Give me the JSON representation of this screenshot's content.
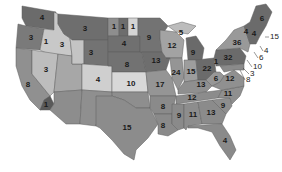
{
  "map": {
    "title": "US electoral votes by state",
    "colors": {
      "dark": "#6b6b6b",
      "medium": "#8e8e8e",
      "light": "#b8b8b8",
      "lighter": "#d0d0d0",
      "water": "#ffffff"
    },
    "states": [
      {
        "id": "WA",
        "votes": "4",
        "x": 42,
        "y": 18
      },
      {
        "id": "OR",
        "votes": "3",
        "x": 31,
        "y": 38
      },
      {
        "id": "ID",
        "votes": "1",
        "x": 46,
        "y": 42
      },
      {
        "id": "MT",
        "votes": "3",
        "x": 85,
        "y": 29
      },
      {
        "id": "ND-a",
        "votes": "1",
        "x": 114,
        "y": 27
      },
      {
        "id": "ND-b",
        "votes": "1",
        "x": 123,
        "y": 27
      },
      {
        "id": "ND-c",
        "votes": "1",
        "x": 133,
        "y": 27
      },
      {
        "id": "WY",
        "votes": "3",
        "x": 62,
        "y": 45
      },
      {
        "id": "SD",
        "votes": "3",
        "x": 91,
        "y": 53
      },
      {
        "id": "NE-upper",
        "votes": "4",
        "x": 124,
        "y": 44
      },
      {
        "id": "NV",
        "votes": "3",
        "x": 46,
        "y": 70
      },
      {
        "id": "CA",
        "votes": "8",
        "x": 28,
        "y": 85
      },
      {
        "id": "CO",
        "votes": "4",
        "x": 98,
        "y": 80
      },
      {
        "id": "KS",
        "votes": "10",
        "x": 131,
        "y": 84
      },
      {
        "id": "NE",
        "votes": "8",
        "x": 127,
        "y": 65
      },
      {
        "id": "AZ",
        "votes": "1",
        "x": 46,
        "y": 105
      },
      {
        "id": "TX",
        "votes": "15",
        "x": 127,
        "y": 128
      },
      {
        "id": "MN",
        "votes": "9",
        "x": 149,
        "y": 38
      },
      {
        "id": "IA",
        "votes": "13",
        "x": 156,
        "y": 61
      },
      {
        "id": "MO",
        "votes": "17",
        "x": 160,
        "y": 85
      },
      {
        "id": "AR",
        "votes": "8",
        "x": 163,
        "y": 107
      },
      {
        "id": "LA",
        "votes": "8",
        "x": 163,
        "y": 126
      },
      {
        "id": "WI",
        "votes": "12",
        "x": 172,
        "y": 46
      },
      {
        "id": "MI-upper",
        "votes": "5",
        "x": 181,
        "y": 33
      },
      {
        "id": "MI",
        "votes": "9",
        "x": 193,
        "y": 53
      },
      {
        "id": "IL",
        "votes": "24",
        "x": 176,
        "y": 73
      },
      {
        "id": "IN",
        "votes": "15",
        "x": 191,
        "y": 72
      },
      {
        "id": "OH",
        "votes": "22",
        "x": 207,
        "y": 69
      },
      {
        "id": "WV-1",
        "votes": "1",
        "x": 216,
        "y": 62
      },
      {
        "id": "KY",
        "votes": "13",
        "x": 201,
        "y": 85
      },
      {
        "id": "WV",
        "votes": "6",
        "x": 216,
        "y": 79
      },
      {
        "id": "VA",
        "votes": "12",
        "x": 230,
        "y": 79
      },
      {
        "id": "TN",
        "votes": "12",
        "x": 192,
        "y": 98
      },
      {
        "id": "NC",
        "votes": "11",
        "x": 228,
        "y": 94
      },
      {
        "id": "SC",
        "votes": "9",
        "x": 223,
        "y": 106
      },
      {
        "id": "MS",
        "votes": "9",
        "x": 179,
        "y": 116
      },
      {
        "id": "AL",
        "votes": "11",
        "x": 193,
        "y": 115
      },
      {
        "id": "GA",
        "votes": "13",
        "x": 211,
        "y": 113
      },
      {
        "id": "FL",
        "votes": "4",
        "x": 225,
        "y": 141
      },
      {
        "id": "PA",
        "votes": "32",
        "x": 228,
        "y": 58
      },
      {
        "id": "NY",
        "votes": "36",
        "x": 237,
        "y": 43
      },
      {
        "id": "VT",
        "votes": "4",
        "x": 246,
        "y": 32
      },
      {
        "id": "NH",
        "votes": "4",
        "x": 254,
        "y": 34
      },
      {
        "id": "ME",
        "votes": "6",
        "x": 262,
        "y": 19
      }
    ],
    "callouts": [
      {
        "id": "MA",
        "votes": "15",
        "lx": 265,
        "ly": 37,
        "tx": 270,
        "ty": 37
      },
      {
        "id": "RI",
        "votes": "4",
        "lx": 260,
        "ly": 46,
        "tx": 264,
        "ty": 51
      },
      {
        "id": "CT",
        "votes": "6",
        "lx": 254,
        "ly": 52,
        "tx": 259,
        "ty": 58
      },
      {
        "id": "NJ",
        "votes": "10",
        "lx": 247,
        "ly": 60,
        "tx": 253,
        "ty": 67
      },
      {
        "id": "DE",
        "votes": "3",
        "lx": 243,
        "ly": 68,
        "tx": 250,
        "ty": 74
      },
      {
        "id": "MD",
        "votes": "8",
        "lx": 240,
        "ly": 70,
        "tx": 246,
        "ty": 80
      }
    ]
  }
}
